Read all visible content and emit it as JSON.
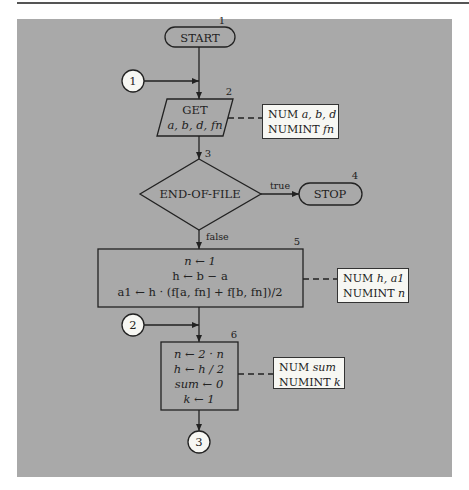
{
  "diagram": {
    "type": "flowchart",
    "nodes": {
      "start": {
        "step": "1",
        "label": "START",
        "shape": "terminal"
      },
      "get": {
        "step": "2",
        "label_line1": "GET",
        "label_line2": "a, b, d, fn",
        "shape": "input-output"
      },
      "eof": {
        "step": "3",
        "label": "END-OF-FILE",
        "shape": "decision",
        "true_label": "true",
        "false_label": "false"
      },
      "stop": {
        "step": "4",
        "label": "STOP",
        "shape": "terminal"
      },
      "process5": {
        "step": "5",
        "shape": "process",
        "lines": [
          "n ← 1",
          "h ← b − a",
          "a1 ← h · (f[a, fn] + f[b, fn])/2"
        ]
      },
      "process6": {
        "step": "6",
        "shape": "process",
        "lines": [
          "n ← 2 · n",
          "h ← h / 2",
          "sum ← 0",
          "k ← 1"
        ]
      }
    },
    "connectors": [
      {
        "id": "1",
        "label": "1",
        "role": "entry"
      },
      {
        "id": "2",
        "label": "2",
        "role": "entry"
      },
      {
        "id": "3",
        "label": "3",
        "role": "exit"
      }
    ],
    "annotations": [
      {
        "attached_to": "get",
        "line1_kw": "NUM",
        "line1_vars": "a, b, d",
        "line2_kw": "NUMINT",
        "line2_vars": "fn"
      },
      {
        "attached_to": "process5",
        "line1_kw": "NUM",
        "line1_vars": "h, a1",
        "line2_kw": "NUMINT",
        "line2_vars": "n"
      },
      {
        "attached_to": "process6",
        "line1_kw": "NUM",
        "line1_vars": "sum",
        "line2_kw": "NUMINT",
        "line2_vars": "k"
      }
    ]
  },
  "colors": {
    "panel_background": "#a9a9a9",
    "annotation_background": "#f7f7f3",
    "stroke": "#222222"
  }
}
